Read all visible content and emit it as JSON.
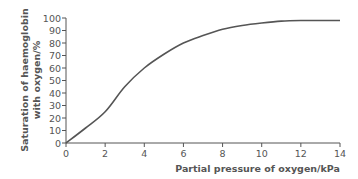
{
  "chart_data": {
    "type": "line",
    "title": "",
    "xlabel": "Partial pressure of oxygen/kPa",
    "ylabel_line1": "Saturation of haemoglobin",
    "ylabel_line2": "with oxygen/%",
    "xlim": [
      0,
      14
    ],
    "ylim": [
      0,
      100
    ],
    "x_ticks": [
      0,
      2,
      4,
      6,
      8,
      10,
      12,
      14
    ],
    "y_ticks": [
      0,
      10,
      20,
      30,
      40,
      50,
      60,
      70,
      80,
      90,
      100
    ],
    "grid": false,
    "legend": null,
    "series": [
      {
        "name": "Oxyhaemoglobin dissociation curve",
        "color": "#555555",
        "x": [
          0,
          1,
          2,
          3,
          4,
          5,
          6,
          7,
          8,
          9,
          10,
          11,
          12,
          13,
          14
        ],
        "y": [
          0,
          12,
          25,
          45,
          60,
          71,
          80,
          86,
          91,
          94,
          96,
          97.5,
          98,
          98,
          98
        ]
      }
    ]
  },
  "colors": {
    "axis": "#555555",
    "text": "#555555",
    "curve": "#555555",
    "background": "#ffffff"
  }
}
